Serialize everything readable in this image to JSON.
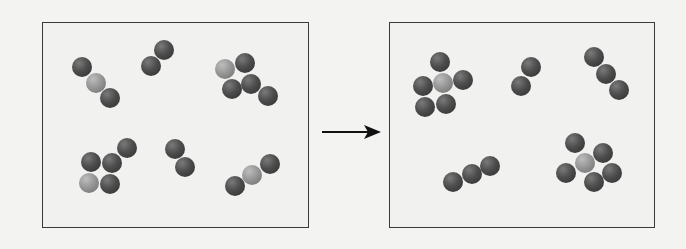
{
  "diagram": {
    "colors": {
      "dark_atom": "#3f3f3f",
      "light_atom": "#9a9a9a",
      "border": "#3a3a3a",
      "background": "#f3f3f2"
    },
    "arrow": {
      "direction": "right",
      "from": "reactants",
      "to": "products"
    },
    "panels": [
      {
        "name": "reactants",
        "molecules": [
          {
            "formula_pattern": "dark-light-dark",
            "atoms": [
              {
                "type": "dark",
                "x": 82,
                "y": 67
              },
              {
                "type": "light",
                "x": 96,
                "y": 83
              },
              {
                "type": "dark",
                "x": 110,
                "y": 98
              }
            ]
          },
          {
            "formula_pattern": "dark-dark",
            "atoms": [
              {
                "type": "dark",
                "x": 164,
                "y": 50
              },
              {
                "type": "dark",
                "x": 151,
                "y": 66
              }
            ]
          },
          {
            "formula_pattern": "light+4 dark",
            "atoms": [
              {
                "type": "light",
                "x": 225,
                "y": 69
              },
              {
                "type": "dark",
                "x": 245,
                "y": 63
              },
              {
                "type": "dark",
                "x": 232,
                "y": 89
              },
              {
                "type": "dark",
                "x": 251,
                "y": 84
              },
              {
                "type": "dark",
                "x": 268,
                "y": 96
              }
            ]
          },
          {
            "formula_pattern": "light+3 dark",
            "atoms": [
              {
                "type": "dark",
                "x": 127,
                "y": 148
              },
              {
                "type": "dark",
                "x": 91,
                "y": 162
              },
              {
                "type": "dark",
                "x": 112,
                "y": 163
              },
              {
                "type": "light",
                "x": 89,
                "y": 183
              },
              {
                "type": "dark",
                "x": 110,
                "y": 184
              }
            ]
          },
          {
            "formula_pattern": "dark-dark",
            "atoms": [
              {
                "type": "dark",
                "x": 175,
                "y": 149
              },
              {
                "type": "dark",
                "x": 185,
                "y": 167
              }
            ]
          },
          {
            "formula_pattern": "dark-light-dark",
            "atoms": [
              {
                "type": "dark",
                "x": 270,
                "y": 164
              },
              {
                "type": "light",
                "x": 252,
                "y": 175
              },
              {
                "type": "dark",
                "x": 235,
                "y": 186
              }
            ]
          }
        ]
      },
      {
        "name": "products",
        "molecules": [
          {
            "formula_pattern": "light center + 5 dark",
            "atoms": [
              {
                "type": "dark",
                "x": 440,
                "y": 62
              },
              {
                "type": "dark",
                "x": 423,
                "y": 86
              },
              {
                "type": "light",
                "x": 443,
                "y": 83
              },
              {
                "type": "dark",
                "x": 463,
                "y": 80
              },
              {
                "type": "dark",
                "x": 425,
                "y": 107
              },
              {
                "type": "dark",
                "x": 446,
                "y": 104
              }
            ]
          },
          {
            "formula_pattern": "dark-dark",
            "atoms": [
              {
                "type": "dark",
                "x": 531,
                "y": 67
              },
              {
                "type": "dark",
                "x": 521,
                "y": 86
              }
            ]
          },
          {
            "formula_pattern": "dark-dark-dark",
            "atoms": [
              {
                "type": "dark",
                "x": 594,
                "y": 57
              },
              {
                "type": "dark",
                "x": 606,
                "y": 74
              },
              {
                "type": "dark",
                "x": 619,
                "y": 90
              }
            ]
          },
          {
            "formula_pattern": "dark-dark-dark",
            "atoms": [
              {
                "type": "dark",
                "x": 453,
                "y": 182
              },
              {
                "type": "dark",
                "x": 472,
                "y": 174
              },
              {
                "type": "dark",
                "x": 490,
                "y": 166
              }
            ]
          },
          {
            "formula_pattern": "light center + 5 dark",
            "atoms": [
              {
                "type": "dark",
                "x": 575,
                "y": 143
              },
              {
                "type": "dark",
                "x": 603,
                "y": 153
              },
              {
                "type": "dark",
                "x": 566,
                "y": 173
              },
              {
                "type": "light",
                "x": 585,
                "y": 163
              },
              {
                "type": "dark",
                "x": 612,
                "y": 173
              },
              {
                "type": "dark",
                "x": 594,
                "y": 182
              }
            ]
          }
        ]
      }
    ]
  }
}
